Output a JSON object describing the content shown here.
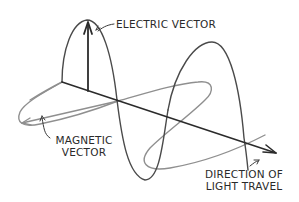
{
  "diagram": {
    "labels": {
      "electric_vector": "ELECTRIC VECTOR",
      "magnetic_vector_line1": "MAGNETIC",
      "magnetic_vector_line2": "VECTOR",
      "direction_line1": "DIRECTION OF",
      "direction_line2": "LIGHT TRAVEL"
    },
    "colors": {
      "axis": "#2b2b2b",
      "electric_wave": "#4a4a4a",
      "magnetic_wave": "#8c8c8c",
      "text": "#2a2a2a",
      "background": "#ffffff"
    }
  }
}
